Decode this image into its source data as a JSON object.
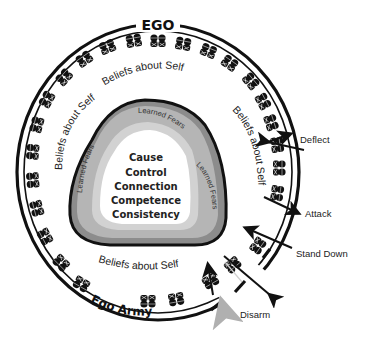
{
  "diagram": {
    "outer_ring_title": "EGO",
    "army_label": "Ego Army",
    "beliefs_label": "Beliefs about Self",
    "beliefs_positions": [
      "top",
      "left",
      "right",
      "bottom"
    ],
    "learned_fears_label": "Learned Fears",
    "core_needs": [
      "Cause",
      "Control",
      "Connection",
      "Competence",
      "Consistency"
    ],
    "responses": [
      {
        "label": "Deflect",
        "direction": "bounce-off"
      },
      {
        "label": "Attack",
        "direction": "outward"
      },
      {
        "label": "Stand Down",
        "direction": "inward"
      },
      {
        "label": "Disarm",
        "direction": "inward-gray"
      }
    ],
    "colors": {
      "ring": "#111111",
      "fear_outer": "#8c8c8c",
      "fear_mid": "#b5b5b5",
      "fear_inner": "#d2d2d2",
      "core": "#ffffff",
      "disarm_arrow": "#b0b0b0"
    }
  }
}
